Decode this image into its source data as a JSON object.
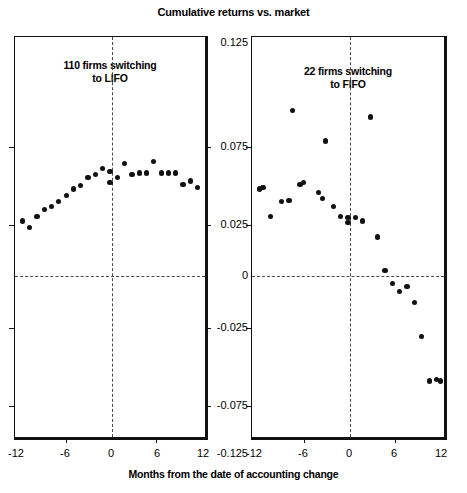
{
  "chart_data": {
    "type": "scatter",
    "title": "Cumulative returns vs. market",
    "xlabel": "Months from the date of accounting change",
    "ylabel": "",
    "xlim": [
      -13,
      13
    ],
    "ylim": [
      -0.125,
      0.125
    ],
    "xticks": [
      -12,
      -6,
      0,
      6,
      12
    ],
    "xtick_labels": [
      "-12",
      "-6",
      "0",
      "6",
      "12"
    ],
    "yticks": [
      0.125,
      0.075,
      0.025,
      0,
      -0.025,
      -0.075,
      -0.125
    ],
    "ytick_labels": [
      "0.125",
      "0.075",
      "0.025",
      "0",
      "-0.025",
      "-0.075",
      "-0.125"
    ],
    "grid": false,
    "legend": "none",
    "reference_lines": {
      "vertical_x": 0,
      "horizontal_y": 0,
      "style": "dashed"
    },
    "panels": [
      {
        "id": "lifo",
        "caption_line1": "110 firms switching",
        "caption_line2": "to LIFO",
        "series_name": "110 firms switching to LIFO",
        "x": [
          -12,
          -11,
          -10,
          -9,
          -8,
          -7,
          -6,
          -5,
          -4,
          -3,
          -2,
          -1,
          0,
          0,
          1,
          2,
          3,
          4,
          5,
          6,
          7,
          8,
          9,
          10,
          11,
          12
        ],
        "y": [
          0.01,
          0.006,
          0.013,
          0.017,
          0.019,
          0.022,
          0.026,
          0.03,
          0.032,
          0.037,
          0.039,
          0.043,
          0.041,
          0.034,
          0.037,
          0.046,
          0.039,
          0.04,
          0.04,
          0.047,
          0.04,
          0.04,
          0.04,
          0.033,
          0.035,
          0.031
        ]
      },
      {
        "id": "fifo",
        "caption_line1": "22 firms switching",
        "caption_line2": "to FIFO",
        "series_name": "22 firms switching to FIFO",
        "x": [
          -12,
          -11.5,
          -10.5,
          -9,
          -8,
          -7.5,
          -6.5,
          -6,
          -4,
          -3.5,
          -3,
          -2,
          -1,
          0,
          0,
          1,
          2,
          3,
          4,
          5,
          6,
          7,
          8,
          9,
          10,
          11,
          12,
          12.5
        ],
        "y": [
          0.03,
          0.031,
          0.013,
          0.022,
          0.023,
          0.079,
          0.033,
          0.034,
          0.028,
          0.024,
          0.06,
          0.019,
          0.013,
          0.012,
          0.009,
          0.012,
          0.01,
          0.075,
          0.0,
          -0.021,
          -0.029,
          -0.034,
          -0.031,
          -0.041,
          -0.062,
          -0.09,
          -0.089,
          -0.09
        ]
      }
    ]
  }
}
